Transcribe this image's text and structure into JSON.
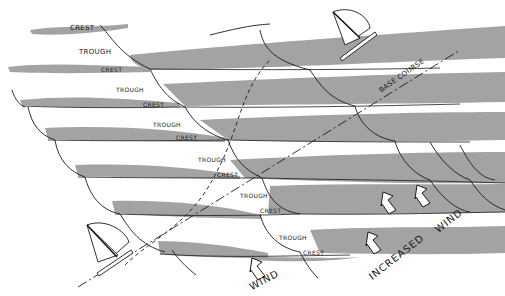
{
  "diagram": {
    "type": "wave-sailing-diagram",
    "colors": {
      "wave_band": "#a3a3a3",
      "line": "#1a1a1a",
      "background": "#ffffff"
    },
    "labels": {
      "crest": "CREST",
      "trough": "TROUGH",
      "base_course": "BASE COURSE",
      "wind": "WIND",
      "increased_wind": "INCREASED",
      "increased_wind_2": "WIND"
    },
    "wave_rows": [
      {
        "crest": "CREST",
        "trough": "TROUGH"
      },
      {
        "crest": "CREST",
        "trough": "TROUGH"
      },
      {
        "crest": "CREST",
        "trough": "TROUGH"
      },
      {
        "crest": "CREST",
        "trough": "TROUGH"
      },
      {
        "crest": "CREST",
        "trough": "TROUGH"
      },
      {
        "crest": "CREST",
        "trough": "TROUGH"
      },
      {
        "crest": "CREST",
        "trough": "TROUGH"
      }
    ],
    "icons": [
      "sailboat-top",
      "sailboat-bottom",
      "wind-arrow",
      "increased-wind-arrows"
    ]
  }
}
